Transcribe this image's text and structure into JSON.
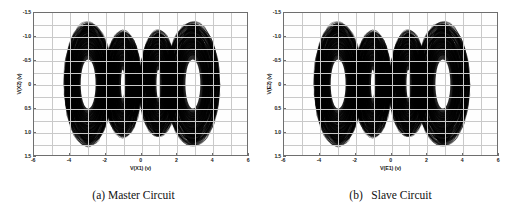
{
  "figure": {
    "background_color": "#ffffff",
    "panel_count": 2
  },
  "panels": [
    {
      "id": "master",
      "caption": "(a) Master Circuit",
      "xlabel": "V(X1) (v)",
      "ylabel": "V(X2) (v)",
      "xticks": [
        "-6",
        "-4",
        "-2",
        "0",
        "2",
        "4",
        "6"
      ],
      "yticks": [
        "1.5",
        "1.0",
        "0.5",
        "0",
        "-0.5",
        "-1.0",
        "-1.5"
      ]
    },
    {
      "id": "slave",
      "caption": "(b)   Slave Circuit",
      "xlabel": "V(E1) (v)",
      "ylabel": "V(E2) (v)",
      "xticks": [
        "-6",
        "-4",
        "-2",
        "0",
        "2",
        "4",
        "6"
      ],
      "yticks": [
        "1.5",
        "1.0",
        "0.5",
        "0",
        "-0.5",
        "-1.0",
        "-1.5"
      ]
    }
  ],
  "chart_data": [
    {
      "type": "scatter",
      "title": "(a) Master Circuit",
      "xlabel": "V(X1) (v)",
      "ylabel": "V(X2) (v)",
      "xlim": [
        -6,
        6
      ],
      "ylim": [
        -1.5,
        1.5
      ],
      "xticks": [
        -6,
        -4,
        -2,
        0,
        2,
        4,
        6
      ],
      "yticks": [
        -1.5,
        -1.0,
        -0.5,
        0,
        0.5,
        1.0,
        1.5
      ],
      "grid": true,
      "legend": "none",
      "description": "Four-scroll chaotic attractor phase portrait of a multi-scroll Chua circuit; dense black trajectory forming four overlapping ring/scroll lobes",
      "trace_color": "#000000",
      "scrolls": [
        {
          "center_x": -2.95,
          "center_y": 0.0,
          "outer_rx": 1.42,
          "outer_ry": 1.3,
          "inner_rx": 0.42,
          "inner_ry": 0.52
        },
        {
          "center_x": -1.0,
          "center_y": 0.0,
          "outer_rx": 1.05,
          "outer_ry": 1.12,
          "inner_rx": 0.1,
          "inner_ry": 0.3
        },
        {
          "center_x": 1.0,
          "center_y": 0.0,
          "outer_rx": 1.05,
          "outer_ry": 1.12,
          "inner_rx": 0.1,
          "inner_ry": 0.3
        },
        {
          "center_x": 2.95,
          "center_y": 0.0,
          "outer_rx": 1.42,
          "outer_ry": 1.3,
          "inner_rx": 0.42,
          "inner_ry": 0.52
        }
      ],
      "x_range_data": [
        -4.4,
        4.4
      ],
      "y_range_data": [
        -1.32,
        1.28
      ]
    },
    {
      "type": "scatter",
      "title": "(b)   Slave Circuit",
      "xlabel": "V(E1) (v)",
      "ylabel": "V(E2) (v)",
      "xlim": [
        -6,
        6
      ],
      "ylim": [
        -1.5,
        1.5
      ],
      "xticks": [
        -6,
        -4,
        -2,
        0,
        2,
        4,
        6
      ],
      "yticks": [
        -1.5,
        -1.0,
        -0.5,
        0,
        0.5,
        1.0,
        1.5
      ],
      "grid": true,
      "legend": "none",
      "description": "Four-scroll chaotic attractor phase portrait of the synchronized slave Chua circuit; visually identical to the master circuit",
      "trace_color": "#000000",
      "scrolls": [
        {
          "center_x": -2.95,
          "center_y": 0.0,
          "outer_rx": 1.42,
          "outer_ry": 1.3,
          "inner_rx": 0.42,
          "inner_ry": 0.52
        },
        {
          "center_x": -1.0,
          "center_y": 0.0,
          "outer_rx": 1.05,
          "outer_ry": 1.12,
          "inner_rx": 0.1,
          "inner_ry": 0.3
        },
        {
          "center_x": 1.0,
          "center_y": 0.0,
          "outer_rx": 1.05,
          "outer_ry": 1.12,
          "inner_rx": 0.1,
          "inner_ry": 0.3
        },
        {
          "center_x": 2.95,
          "center_y": 0.0,
          "outer_rx": 1.42,
          "outer_ry": 1.3,
          "inner_rx": 0.42,
          "inner_ry": 0.52
        }
      ],
      "x_range_data": [
        -4.4,
        4.4
      ],
      "y_range_data": [
        -1.32,
        1.28
      ]
    }
  ]
}
